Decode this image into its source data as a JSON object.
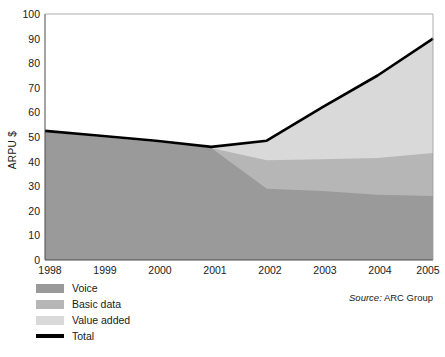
{
  "chart_data": {
    "type": "area",
    "stacked": true,
    "title": "",
    "xlabel": "",
    "ylabel": "ARPU $",
    "categories": [
      "1998",
      "1999",
      "2000",
      "2001",
      "2002",
      "2003",
      "2004",
      "2005"
    ],
    "x": [
      1998,
      1999,
      2000,
      2001,
      2002,
      2003,
      2004,
      2005
    ],
    "ylim": [
      0,
      100
    ],
    "xlim": [
      1998,
      2005
    ],
    "yticks": [
      0,
      10,
      20,
      30,
      40,
      50,
      60,
      70,
      80,
      90,
      100
    ],
    "grid": false,
    "legend_position": "bottom-left",
    "series": [
      {
        "name": "Voice",
        "kind": "area",
        "color": "#9a9a9a",
        "values": [
          52,
          50,
          48,
          45.5,
          29,
          28,
          26.5,
          26
        ]
      },
      {
        "name": "Basic data",
        "kind": "area",
        "color": "#b6b6b6",
        "values": [
          0,
          0,
          0,
          0,
          11.5,
          13,
          15,
          17.5
        ],
        "cumulative": [
          52,
          50,
          48,
          45.5,
          40.5,
          41,
          41.5,
          43.5
        ]
      },
      {
        "name": "Value added",
        "kind": "area",
        "color": "#d9d9d9",
        "values": [
          0.5,
          0.5,
          0.5,
          0.5,
          8,
          21,
          33.5,
          46.5
        ],
        "cumulative": [
          52.5,
          50.5,
          48.5,
          46,
          48.5,
          62,
          75,
          90
        ]
      },
      {
        "name": "Total",
        "kind": "line",
        "color": "#000000",
        "values": [
          52.5,
          50.5,
          48.5,
          46,
          48.5,
          62,
          75,
          90
        ]
      }
    ]
  },
  "axes": {
    "y_label": "ARPU $",
    "y_ticks": [
      "100",
      "90",
      "80",
      "70",
      "60",
      "50",
      "40",
      "30",
      "20",
      "10",
      "0"
    ],
    "x_ticks": [
      "1998",
      "1999",
      "2000",
      "2001",
      "2002",
      "2003",
      "2004",
      "2005"
    ]
  },
  "legend": {
    "items": [
      {
        "label": "Voice",
        "swatch": "#9a9a9a",
        "type": "box"
      },
      {
        "label": "Basic data",
        "swatch": "#b6b6b6",
        "type": "box"
      },
      {
        "label": "Value added",
        "swatch": "#d9d9d9",
        "type": "box"
      },
      {
        "label": "Total",
        "swatch": "#000000",
        "type": "line"
      }
    ]
  },
  "source": {
    "prefix": "Source:",
    "value": " ARC Group"
  },
  "colors": {
    "voice": "#9a9a9a",
    "basic_data": "#b6b6b6",
    "value_added": "#d9d9d9",
    "total": "#000000",
    "axis": "#3a3a3a",
    "background": "#ffffff"
  }
}
